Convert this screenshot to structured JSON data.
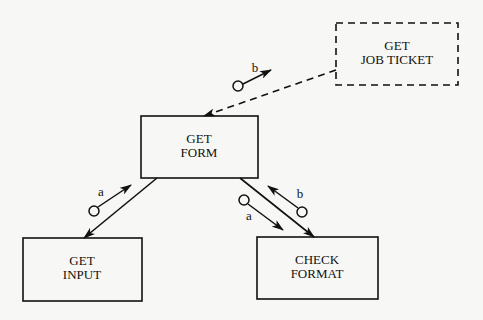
{
  "diagram": {
    "type": "structure-chart",
    "modules": {
      "get_job_ticket": {
        "line1": "GET",
        "line2": "JOB TICKET",
        "style": "dashed"
      },
      "get_form": {
        "line1": "GET",
        "line2": "FORM",
        "style": "solid"
      },
      "get_input": {
        "line1": "GET",
        "line2": "INPUT",
        "style": "solid"
      },
      "check_format": {
        "line1": "CHECK",
        "line2": "FORMAT",
        "style": "solid"
      }
    },
    "couples": {
      "jobticket_to_form_b": {
        "label": "b",
        "direction": "from GET FORM to GET JOB TICKET"
      },
      "form_input_a": {
        "label": "a",
        "direction": "from GET INPUT to GET FORM"
      },
      "form_check_a": {
        "label": "a",
        "direction": "from GET FORM to CHECK FORMAT"
      },
      "form_check_b": {
        "label": "b",
        "direction": "from CHECK FORMAT to GET FORM"
      }
    },
    "connections": [
      {
        "from": "GET JOB TICKET",
        "to": "GET FORM",
        "style": "dashed"
      },
      {
        "from": "GET FORM",
        "to": "GET INPUT",
        "style": "solid"
      },
      {
        "from": "GET FORM",
        "to": "CHECK FORMAT",
        "style": "solid"
      }
    ],
    "colors": {
      "stroke": "#111111",
      "background": "#f7f7f5"
    }
  }
}
